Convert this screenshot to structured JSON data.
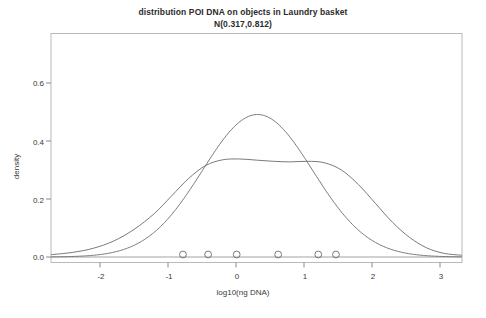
{
  "chart_data": {
    "type": "line",
    "title": "distribution POI DNA on objects in Laundry basket",
    "subtitle": "N(0.317,0.812)",
    "xlabel": "log10(ng DNA)",
    "ylabel": "density",
    "xlim": [
      -2.72,
      3.32
    ],
    "ylim": [
      0.0,
      0.72
    ],
    "grid": false,
    "legend": "none",
    "xticks": [
      -2,
      -1,
      0,
      1,
      2,
      3
    ],
    "xtick_labels": [
      "-2",
      "-1",
      "0",
      "1",
      "2",
      "3"
    ],
    "yticks": [
      0.0,
      0.2,
      0.4,
      0.6
    ],
    "ytick_labels": [
      "0.0",
      "0.2",
      "0.4",
      "0.6"
    ],
    "series": [
      {
        "name": "normal fit N(0.317,0.812)",
        "kind": "normal-pdf",
        "mean": 0.317,
        "sd": 0.812,
        "peak_density": 0.491,
        "color": "#6b6b6b"
      },
      {
        "name": "kernel density estimate",
        "kind": "kde",
        "plateau_density": 0.335,
        "color": "#6b6b6b",
        "x": [
          -2.72,
          -2.4,
          -2.1,
          -1.8,
          -1.5,
          -1.2,
          -0.95,
          -0.7,
          -0.45,
          -0.2,
          0.05,
          0.3,
          0.55,
          0.8,
          1.05,
          1.3,
          1.55,
          1.8,
          2.05,
          2.3,
          2.55,
          2.8,
          3.05,
          3.32
        ],
        "y": [
          0.008,
          0.016,
          0.03,
          0.055,
          0.095,
          0.15,
          0.21,
          0.27,
          0.315,
          0.335,
          0.338,
          0.334,
          0.33,
          0.328,
          0.33,
          0.325,
          0.3,
          0.25,
          0.185,
          0.12,
          0.068,
          0.032,
          0.013,
          0.006
        ]
      }
    ],
    "data_points": {
      "name": "observed values (rug circles)",
      "marker": "open-circle",
      "y_position": 0.0,
      "values": [
        -0.78,
        -0.41,
        0.01,
        0.62,
        1.21,
        1.47
      ]
    },
    "colors": {
      "curve": "#6b6b6b",
      "axis": "#8a8a8a",
      "text": "#3a3a3a",
      "background": "#ffffff"
    }
  }
}
